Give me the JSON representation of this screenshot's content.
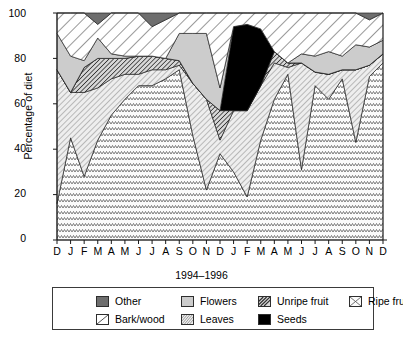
{
  "chart_data": {
    "type": "area",
    "stacked": true,
    "title": "",
    "xlabel": "1994–1996",
    "ylabel": "Percentage of diet",
    "ylim": [
      0,
      100
    ],
    "yticks": [
      0,
      20,
      40,
      60,
      80,
      100
    ],
    "grid": false,
    "legend_position": "below",
    "categories": [
      "D",
      "J",
      "F",
      "M",
      "A",
      "M",
      "J",
      "J",
      "A",
      "S",
      "O",
      "N",
      "D",
      "J",
      "F",
      "M",
      "A",
      "M",
      "J",
      "J",
      "A",
      "S",
      "O",
      "N",
      "D"
    ],
    "x_full_labels": [
      "Dec 1994",
      "Jan 1995",
      "Feb 1995",
      "Mar 1995",
      "Apr 1995",
      "May 1995",
      "Jun 1995",
      "Jul 1995",
      "Aug 1995",
      "Sep 1995",
      "Oct 1995",
      "Nov 1995",
      "Dec 1995",
      "Jan 1996",
      "Feb 1996",
      "Mar 1996",
      "Apr 1996",
      "May 1996",
      "Jun 1996",
      "Jul 1996",
      "Aug 1996",
      "Sep 1996",
      "Oct 1996",
      "Nov 1996",
      "Dec 1996"
    ],
    "stack_order_bottom_to_top": [
      "Ripe fruit",
      "Leaves",
      "Unripe fruit",
      "Seeds",
      "Flowers",
      "Bark/wood",
      "Other"
    ],
    "series": [
      {
        "name": "Ripe fruit",
        "pattern": "zigzag-cross",
        "values": [
          16,
          45,
          28,
          44,
          55,
          62,
          68,
          68,
          71,
          75,
          46,
          22,
          38,
          30,
          19,
          44,
          62,
          73,
          31,
          68,
          62,
          71,
          43,
          72,
          78
        ]
      },
      {
        "name": "Leaves",
        "pattern": "diagonal-hatch-light",
        "values": [
          59,
          20,
          37,
          23,
          16,
          11,
          5,
          7,
          4,
          2,
          23,
          40,
          6,
          27,
          38,
          24,
          16,
          3,
          47,
          6,
          11,
          4,
          32,
          5,
          4
        ]
      },
      {
        "name": "Unripe fruit",
        "pattern": "diagonal-hatch-dark",
        "values": [
          0,
          0,
          11,
          13,
          9,
          7,
          8,
          6,
          5,
          2,
          0,
          0,
          13,
          0,
          0,
          0,
          5,
          2,
          0,
          0,
          0,
          0,
          0,
          0,
          0
        ]
      },
      {
        "name": "Seeds",
        "pattern": "solid-black",
        "values": [
          0,
          0,
          0,
          0,
          0,
          0,
          0,
          0,
          0,
          0,
          0,
          0,
          0,
          37,
          38,
          25,
          0,
          0,
          0,
          0,
          0,
          0,
          0,
          0,
          0
        ]
      },
      {
        "name": "Flowers",
        "pattern": "solid-lightgray",
        "values": [
          16,
          16,
          3,
          9,
          2,
          1,
          0,
          0,
          0,
          12,
          22,
          29,
          10,
          0,
          0,
          0,
          0,
          0,
          4,
          7,
          10,
          6,
          11,
          8,
          6
        ]
      },
      {
        "name": "Bark/wood",
        "pattern": "diagonal-white",
        "values": [
          9,
          19,
          21,
          6,
          18,
          19,
          19,
          13,
          17,
          9,
          9,
          9,
          33,
          6,
          5,
          7,
          17,
          22,
          18,
          19,
          17,
          19,
          14,
          12,
          12
        ]
      },
      {
        "name": "Other",
        "pattern": "solid-darkgray",
        "values": [
          0,
          0,
          0,
          5,
          0,
          0,
          0,
          6,
          3,
          0,
          0,
          0,
          0,
          0,
          0,
          0,
          0,
          0,
          0,
          0,
          0,
          0,
          0,
          3,
          0
        ]
      }
    ]
  },
  "axes": {
    "y_tick_labels": [
      "100",
      "80",
      "60",
      "40",
      "20",
      "0"
    ],
    "y_axis_title": "Percentage of diet",
    "x_axis_title": "1994–1996",
    "x_tick_labels": [
      "D",
      "J",
      "F",
      "M",
      "A",
      "M",
      "J",
      "J",
      "A",
      "S",
      "O",
      "N",
      "D",
      "J",
      "F",
      "M",
      "A",
      "M",
      "J",
      "J",
      "A",
      "S",
      "O",
      "N",
      "D"
    ]
  },
  "legend": {
    "items": [
      {
        "label": "Other",
        "swatch": "solid-darkgray",
        "color": "#6e6e6e"
      },
      {
        "label": "Flowers",
        "swatch": "solid-lightgray",
        "color": "#cccccc"
      },
      {
        "label": "Unripe fruit",
        "swatch": "diagonal-hatch-dark",
        "color": "#b4b4b4"
      },
      {
        "label": "Ripe fruit",
        "swatch": "zigzag-cross",
        "color": "#f2f2f2"
      },
      {
        "label": "Bark/wood",
        "swatch": "diagonal-white",
        "color": "#ffffff"
      },
      {
        "label": "Leaves",
        "swatch": "diagonal-hatch-light",
        "color": "#dcdcdc"
      },
      {
        "label": "Seeds",
        "swatch": "solid-black",
        "color": "#000000"
      }
    ]
  },
  "colors": {
    "other": "#6e6e6e",
    "flowers": "#cccccc",
    "unripe_fruit": "#b4b4b4",
    "ripe_fruit": "#f4f4f4",
    "bark_wood": "#ffffff",
    "leaves": "#e2e2e2",
    "seeds": "#000000",
    "axis": "#1a1a1a",
    "background": "#ffffff"
  }
}
